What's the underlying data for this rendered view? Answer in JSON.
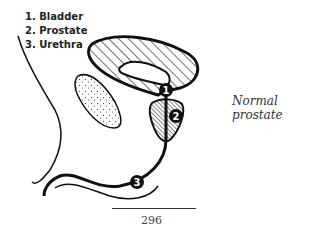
{
  "legend": {
    "items": [
      {
        "number": "1",
        "label": "1. Bladder"
      },
      {
        "number": "2",
        "label": "2. Prostate"
      },
      {
        "number": "3",
        "label": "3. Urethra"
      }
    ]
  },
  "caption": "Normal prostate",
  "page_number": "296",
  "markers": [
    {
      "id": "1",
      "label": "1"
    },
    {
      "id": "2",
      "label": "2"
    },
    {
      "id": "3",
      "label": "3"
    }
  ]
}
